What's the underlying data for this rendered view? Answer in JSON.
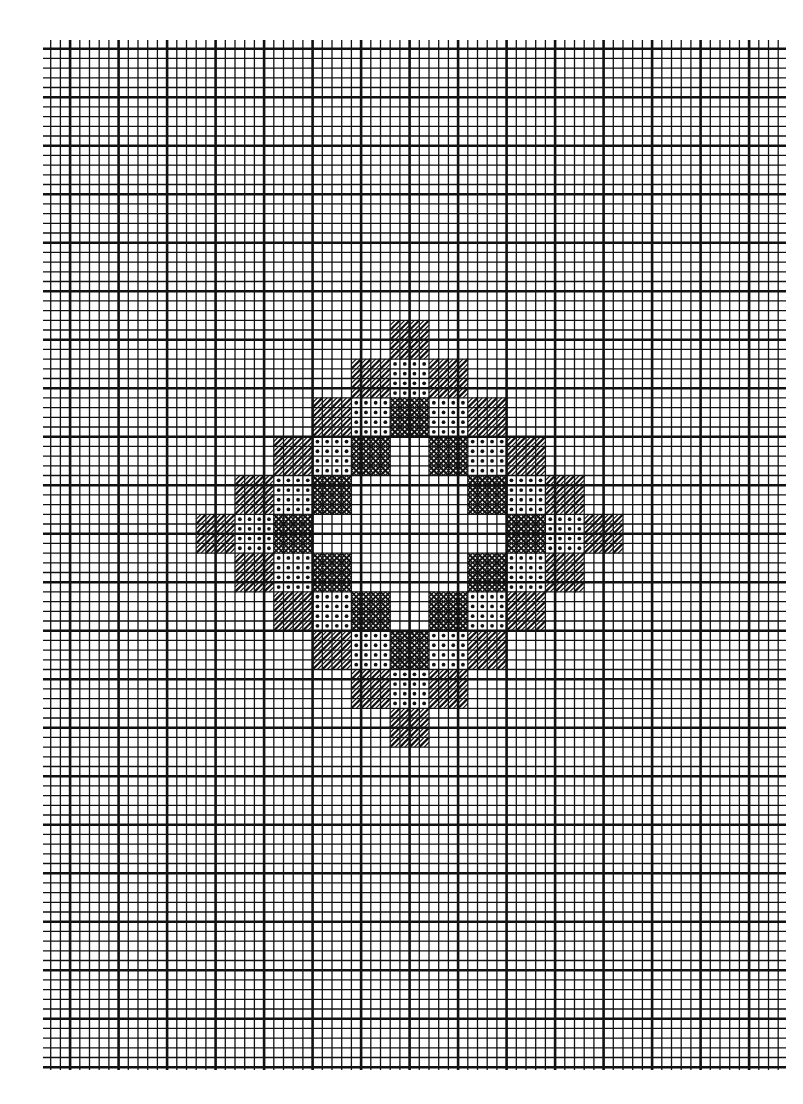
{
  "chart_data": {
    "type": "stitch-chart",
    "title": "",
    "grid": {
      "origin_x": 41,
      "origin_y": 39,
      "cell_size": 9.7,
      "cols": 77,
      "rows": 107,
      "clip_left": 43,
      "clip_top": 40,
      "clip_right": 786,
      "clip_bottom": 1070,
      "major_every": 5,
      "line_color": "#111111",
      "background": "#ffffff"
    },
    "legend_symbols": {
      "H": "diagonal-hatch",
      "D": "dot",
      "X": "cross-hatch",
      ".": "empty"
    },
    "motif": {
      "block_size_cells": 4,
      "start_col": 16,
      "start_row": 29,
      "rows": [
        ".....H.....",
        "....HDH....",
        "...HDXDH...",
        "..HDX.XDH..",
        ".HDX...XDH.",
        "HDX.....XDH",
        ".HDX...XDH.",
        "..HDX.XDH..",
        "...HDXDH...",
        "....HDH....",
        ".....H....."
      ]
    }
  }
}
